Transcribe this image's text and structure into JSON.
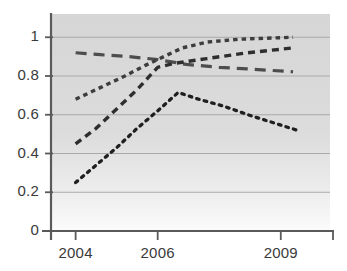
{
  "chart_data": {
    "type": "line",
    "title": "",
    "xlabel": "",
    "ylabel": "",
    "x": [
      2004,
      2006,
      2009
    ],
    "xtick_labels": [
      "2004",
      "2006",
      "2009"
    ],
    "ytick_labels": [
      "0",
      "0.2",
      "0.4",
      "0.6",
      "0.8",
      "1"
    ],
    "ytick_values": [
      0,
      0.2,
      0.4,
      0.6,
      0.8,
      1
    ],
    "ylim": [
      0,
      1.12
    ],
    "xlim": [
      2003.4,
      2010.2
    ],
    "grid": "horizontal",
    "legend": "none",
    "plot_background": "#d9d9d9",
    "series": [
      {
        "name": "series-1-long-dashed",
        "style": "long-dashed",
        "color": "#4d4d4d",
        "points": [
          {
            "x": 2004.0,
            "y": 0.92
          },
          {
            "x": 2004.6,
            "y": 0.91
          },
          {
            "x": 2005.3,
            "y": 0.9
          },
          {
            "x": 2006.0,
            "y": 0.885
          },
          {
            "x": 2006.7,
            "y": 0.86
          },
          {
            "x": 2007.5,
            "y": 0.845
          },
          {
            "x": 2008.3,
            "y": 0.835
          },
          {
            "x": 2009.3,
            "y": 0.822
          }
        ],
        "values": [
          0.92,
          0.885,
          0.822
        ]
      },
      {
        "name": "series-2-dotted-top",
        "style": "dotted-thick",
        "color": "#3d3d3d",
        "points": [
          {
            "x": 2004.0,
            "y": 0.68
          },
          {
            "x": 2004.6,
            "y": 0.74
          },
          {
            "x": 2005.2,
            "y": 0.8
          },
          {
            "x": 2005.7,
            "y": 0.855
          },
          {
            "x": 2006.0,
            "y": 0.885
          },
          {
            "x": 2006.6,
            "y": 0.945
          },
          {
            "x": 2007.2,
            "y": 0.975
          },
          {
            "x": 2008.0,
            "y": 0.99
          },
          {
            "x": 2009.3,
            "y": 1.0
          }
        ],
        "values": [
          0.68,
          0.885,
          1.0
        ]
      },
      {
        "name": "series-3-dashed-mid",
        "style": "dashed",
        "color": "#2e2e2e",
        "points": [
          {
            "x": 2004.0,
            "y": 0.45
          },
          {
            "x": 2004.5,
            "y": 0.53
          },
          {
            "x": 2005.0,
            "y": 0.63
          },
          {
            "x": 2005.5,
            "y": 0.73
          },
          {
            "x": 2006.0,
            "y": 0.845
          },
          {
            "x": 2006.4,
            "y": 0.865
          },
          {
            "x": 2007.2,
            "y": 0.89
          },
          {
            "x": 2008.2,
            "y": 0.92
          },
          {
            "x": 2009.3,
            "y": 0.945
          }
        ],
        "values": [
          0.45,
          0.845,
          0.945
        ]
      },
      {
        "name": "series-4-fine-dotted",
        "style": "dotted-fine",
        "color": "#1f1f1f",
        "points": [
          {
            "x": 2004.0,
            "y": 0.25
          },
          {
            "x": 2004.5,
            "y": 0.34
          },
          {
            "x": 2005.0,
            "y": 0.43
          },
          {
            "x": 2005.5,
            "y": 0.53
          },
          {
            "x": 2006.0,
            "y": 0.62
          },
          {
            "x": 2006.5,
            "y": 0.715
          },
          {
            "x": 2007.0,
            "y": 0.68
          },
          {
            "x": 2007.6,
            "y": 0.645
          },
          {
            "x": 2008.2,
            "y": 0.6
          },
          {
            "x": 2008.8,
            "y": 0.56
          },
          {
            "x": 2009.4,
            "y": 0.52
          }
        ],
        "values": [
          0.25,
          0.62,
          0.52
        ]
      }
    ]
  }
}
